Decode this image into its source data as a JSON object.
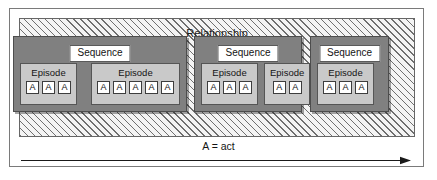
{
  "figure": {
    "legend": "A = act",
    "relationship": {
      "label": "Relationship"
    },
    "sequences": [
      {
        "label": "Sequence",
        "episodes": [
          {
            "label": "Episode",
            "acts": [
              "A",
              "A",
              "A"
            ]
          },
          {
            "label": "Episode",
            "acts": [
              "A",
              "A",
              "A",
              "A",
              "A"
            ]
          }
        ]
      },
      {
        "label": "Sequence",
        "episodes": [
          {
            "label": "Episode",
            "acts": [
              "A",
              "A",
              "A"
            ]
          },
          {
            "label": "Episode",
            "acts": [
              "A",
              "A"
            ]
          }
        ]
      },
      {
        "label": "Sequence",
        "episodes": [
          {
            "label": "Episode",
            "acts": [
              "A",
              "A",
              "A"
            ]
          }
        ]
      }
    ]
  },
  "chart_data": {
    "type": "diagram",
    "title": "Relationship",
    "levels": [
      "Relationship",
      "Sequence",
      "Episode",
      "A"
    ],
    "legend": "A = act",
    "axis": "time (left to right arrow)",
    "counts": {
      "sequences": 3,
      "episodes_per_sequence": [
        2,
        2,
        1
      ],
      "acts_per_episode": [
        [
          3,
          5
        ],
        [
          3,
          2
        ],
        [
          3
        ]
      ]
    },
    "colors": {
      "relationship_fill": "#f4f4f4",
      "relationship_hatch": "#6f6f6f",
      "sequence_fill": "#808080",
      "episode_fill": "#c9c9c9",
      "act_fill": "#ffffff",
      "frame": "#7a7a7a"
    }
  }
}
